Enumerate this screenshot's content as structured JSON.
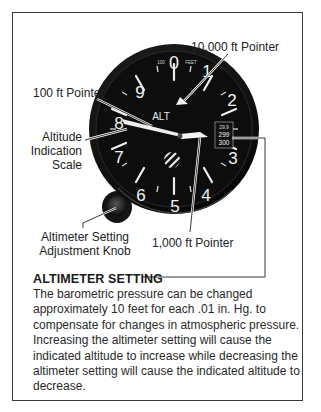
{
  "figure": {
    "gauge": {
      "face_label": "ALT",
      "units_label_small": "100",
      "units_label_feet": "FEET",
      "dial_numbers": [
        "0",
        "1",
        "2",
        "3",
        "4",
        "5",
        "6",
        "7",
        "8",
        "9"
      ],
      "kollsman_window": {
        "top_text": "29.9",
        "mid_text": "299",
        "bottom_text": "300"
      }
    },
    "callouts": {
      "ten_thousand_pointer": "10,000 ft Pointer",
      "hundred_pointer": "100 ft Pointer",
      "altitude_scale": [
        "Altitude",
        "Indication",
        "Scale"
      ],
      "knob": [
        "Altimeter Setting",
        "Adjustment Knob"
      ],
      "thousand_pointer": "1,000 ft Pointer"
    },
    "colors": {
      "gauge_face": "#0d0d0d",
      "gauge_bezel": "#1f1f1f",
      "markings": "#f2f2f2",
      "frame": "#3a3a3a",
      "leader": "#222222"
    }
  },
  "caption": {
    "heading": "ALTIMETER SETTING",
    "lines": [
      "The barometric pressure can be changed",
      "approximately 10 feet for each .01 in. Hg. to",
      "compensate for changes in atmospheric pressure.",
      "Increasing the altimeter setting will cause the",
      "indicated altitude to increase while decreasing the",
      "altimeter setting will cause the indicated altitude to",
      "decrease."
    ]
  }
}
